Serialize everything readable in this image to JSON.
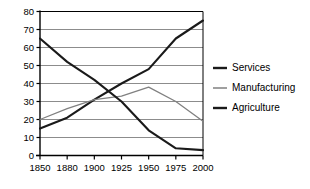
{
  "chart_data": {
    "type": "line",
    "title": "",
    "xlabel": "",
    "ylabel": "",
    "categories": [
      "1850",
      "1880",
      "1900",
      "1925",
      "1950",
      "1975",
      "2000"
    ],
    "x": [
      1850,
      1880,
      1900,
      1925,
      1950,
      1975,
      2000
    ],
    "series": [
      {
        "name": "Services",
        "color": "#1a1a1a",
        "values": [
          15,
          21,
          31,
          40,
          48,
          65,
          75
        ]
      },
      {
        "name": "Manufacturing",
        "color": "#808080",
        "values": [
          20,
          26,
          31,
          33,
          38,
          30,
          19
        ]
      },
      {
        "name": "Agriculture",
        "color": "#1a1a1a",
        "values": [
          65,
          52,
          42,
          30,
          14,
          4,
          3
        ]
      }
    ],
    "ylim": [
      0,
      80
    ],
    "yticks": [
      0,
      10,
      20,
      30,
      40,
      50,
      60,
      70,
      80
    ],
    "ytick_labels": [
      "0",
      "10",
      "20",
      "30",
      "40",
      "50",
      "60",
      "70",
      "80"
    ],
    "grid": true,
    "grid_color": "#8c8c8c",
    "axis_color": "#000000",
    "legend_position": "right",
    "legend": [
      "Services",
      "Manufacturing",
      "Agriculture"
    ]
  }
}
